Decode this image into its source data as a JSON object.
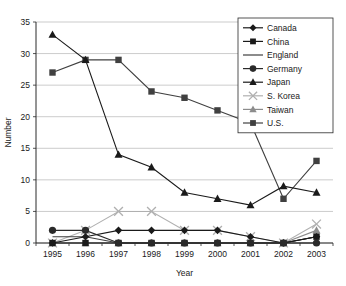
{
  "chart_data": {
    "type": "line",
    "title": "",
    "xlabel": "Year",
    "ylabel": "Number",
    "categories": [
      "1995",
      "1996",
      "1997",
      "1998",
      "1999",
      "2000",
      "2001",
      "2002",
      "2003"
    ],
    "ylim": [
      0,
      35
    ],
    "yticks": [
      0,
      5,
      10,
      15,
      20,
      25,
      30,
      35
    ],
    "grid": "horizontal",
    "legend_position": "top-right",
    "series": [
      {
        "name": "Canada",
        "marker": "diamond",
        "color": "#1a1a1a",
        "values": [
          0,
          1,
          2,
          2,
          2,
          2,
          1,
          0,
          1
        ]
      },
      {
        "name": "China",
        "marker": "square",
        "color": "#1a1a1a",
        "values": [
          0,
          0,
          0,
          0,
          0,
          0,
          0,
          0,
          1
        ]
      },
      {
        "name": "England",
        "marker": "none",
        "color": "#3f3f3f",
        "values": [
          1,
          1,
          0,
          0,
          0,
          0,
          0,
          0,
          1
        ]
      },
      {
        "name": "Germany",
        "marker": "circle",
        "color": "#2a2a2a",
        "values": [
          2,
          2,
          0,
          0,
          0,
          0,
          0,
          0,
          0
        ]
      },
      {
        "name": "Japan",
        "marker": "triangle",
        "color": "#1a1a1a",
        "values": [
          33,
          29,
          14,
          12,
          8,
          7,
          6,
          9,
          8
        ]
      },
      {
        "name": "S. Korea",
        "marker": "cross",
        "color": "#b0b0b0",
        "values": [
          0,
          2,
          5,
          5,
          2,
          2,
          1,
          0,
          3
        ]
      },
      {
        "name": "Taiwan",
        "marker": "triangle",
        "color": "#8c8c8c",
        "values": [
          0,
          0,
          0,
          0,
          0,
          0,
          0,
          0,
          2
        ]
      },
      {
        "name": "U.S.",
        "marker": "square",
        "color": "#404040",
        "values": [
          27,
          29,
          29,
          24,
          23,
          21,
          19,
          7,
          13
        ]
      }
    ]
  },
  "legend": {
    "entries": [
      "Canada",
      "China",
      "England",
      "Germany",
      "Japan",
      "S. Korea",
      "Taiwan",
      "U.S."
    ]
  },
  "axes": {
    "y_title": "Number",
    "x_title": "Year",
    "y_tick_labels": [
      "0",
      "5",
      "10",
      "15",
      "20",
      "25",
      "30",
      "35"
    ],
    "x_tick_labels": [
      "1995",
      "1996",
      "1997",
      "1998",
      "1999",
      "2000",
      "2001",
      "2002",
      "2003"
    ]
  }
}
